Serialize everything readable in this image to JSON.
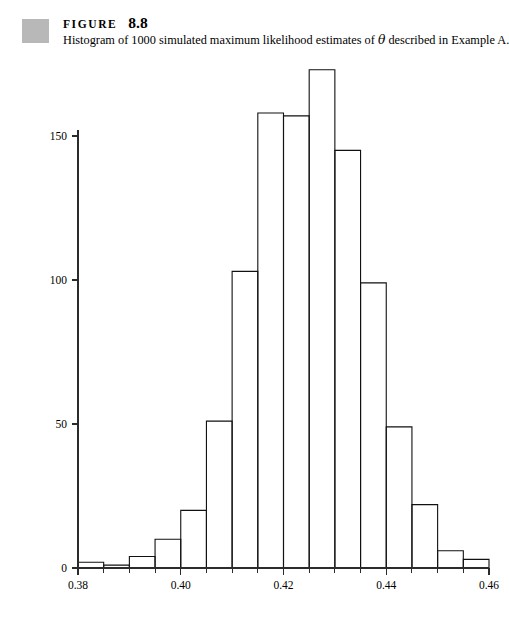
{
  "figure": {
    "label_word": "FIGURE",
    "number": "8.8",
    "caption_before_theta": "Histogram of 1000 simulated maximum likelihood estimates of ",
    "theta_symbol": "θ",
    "caption_after_theta": " described in Example A.",
    "caption_full": "Histogram of 1000 simulated maximum likelihood estimates of θ described in Example A.",
    "swatch_color": "#b8b8b8"
  },
  "chart_data": {
    "type": "bar",
    "title": "",
    "subtitle": "",
    "xlabel": "",
    "ylabel": "",
    "orientation": "vertical",
    "grid": false,
    "legend": null,
    "bar_style": "outlined-histogram",
    "bar_fill": "#ffffff",
    "bar_stroke": "#111111",
    "bin_width": 0.005,
    "xlim": [
      0.38,
      0.46
    ],
    "ylim": [
      0,
      180
    ],
    "x_ticks": [
      0.38,
      0.4,
      0.42,
      0.44,
      0.46
    ],
    "x_tick_labels": [
      "0.38",
      "0.40",
      "0.42",
      "0.44",
      "0.46"
    ],
    "x_minor_ticks": [
      0.385,
      0.39,
      0.395,
      0.405,
      0.41,
      0.415,
      0.425,
      0.43,
      0.435,
      0.445,
      0.45,
      0.455
    ],
    "y_ticks": [
      0,
      50,
      100,
      150
    ],
    "y_tick_labels": [
      "0",
      "50",
      "100",
      "150"
    ],
    "categories": [
      "0.380-0.385",
      "0.385-0.390",
      "0.390-0.395",
      "0.395-0.400",
      "0.400-0.405",
      "0.405-0.410",
      "0.410-0.415",
      "0.415-0.420",
      "0.420-0.425",
      "0.425-0.430",
      "0.430-0.435",
      "0.435-0.440",
      "0.440-0.445",
      "0.445-0.450",
      "0.450-0.455",
      "0.455-0.460"
    ],
    "bin_edges": [
      0.38,
      0.385,
      0.39,
      0.395,
      0.4,
      0.405,
      0.41,
      0.415,
      0.42,
      0.425,
      0.43,
      0.435,
      0.44,
      0.445,
      0.45,
      0.455,
      0.46
    ],
    "values": [
      2,
      1,
      4,
      10,
      20,
      51,
      103,
      158,
      157,
      173,
      145,
      99,
      49,
      22,
      6,
      3
    ],
    "total_observations": 1000
  }
}
